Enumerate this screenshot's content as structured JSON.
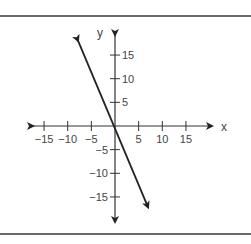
{
  "chart_data": {
    "type": "line",
    "title": "",
    "xlabel": "x",
    "ylabel": "y",
    "xlim": [
      -19,
      19
    ],
    "ylim": [
      -19,
      19
    ],
    "grid": false,
    "x_ticks": [
      -15,
      -10,
      -5,
      5,
      10,
      15
    ],
    "y_ticks": [
      15,
      10,
      5,
      -5,
      -10,
      -15
    ],
    "x_tick_labels": [
      "−15",
      "−10",
      "−5",
      "5",
      "10",
      "15"
    ],
    "y_tick_labels": [
      "15",
      "10",
      "5",
      "−5",
      "−10",
      "−15"
    ],
    "series": [
      {
        "name": "line",
        "equation": "y = -2.4x",
        "x": [
          -7.8,
          7.0
        ],
        "y": [
          18.0,
          -17.2
        ],
        "arrows": "both",
        "color": "#222222"
      }
    ],
    "legend": null
  },
  "labels": {
    "x_axis": "x",
    "y_axis": "y"
  }
}
